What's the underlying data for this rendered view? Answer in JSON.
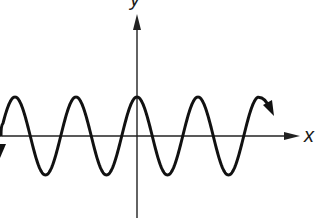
{
  "figure": {
    "type": "cosine-graph",
    "axes": {
      "x_label": "x",
      "y_label": "y",
      "origin_px": [
        137,
        136
      ]
    },
    "curve": {
      "function": "cosine",
      "amplitude_px": 39,
      "period_px": 61,
      "peak_at_origin": true,
      "end_arrows": true
    },
    "colors": {
      "curve": "#111111",
      "axes": "#222222",
      "background": "#ffffff"
    }
  }
}
